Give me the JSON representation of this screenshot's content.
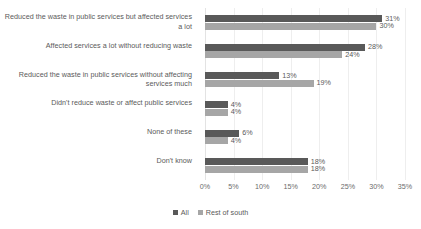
{
  "chart_data": {
    "type": "bar",
    "orientation": "horizontal",
    "title": "",
    "subtitle": "",
    "xlabel": "",
    "ylabel": "",
    "xlim": [
      0,
      35
    ],
    "grid": true,
    "legend_position": "bottom",
    "axis_ticks": [
      "0%",
      "5%",
      "10%",
      "15%",
      "20%",
      "25%",
      "30%",
      "35%"
    ],
    "axis_tick_values": [
      0,
      5,
      10,
      15,
      20,
      25,
      30,
      35
    ],
    "categories": [
      "Reduced the waste in public services but affected services a lot",
      "Affected services a lot without reducing waste",
      "Reduced the waste in public services without affecting services much",
      "Didn't reduce waste or affect public services",
      "None of these",
      "Don't know"
    ],
    "series": [
      {
        "name": "All",
        "color": "#595959",
        "values": [
          31,
          28,
          13,
          4,
          6,
          18
        ],
        "labels": [
          "31%",
          "28%",
          "13%",
          "4%",
          "6%",
          "18%"
        ]
      },
      {
        "name": "Rest of south",
        "color": "#a6a6a6",
        "values": [
          30,
          24,
          19,
          4,
          4,
          18
        ],
        "labels": [
          "30%",
          "24%",
          "19%",
          "4%",
          "4%",
          "18%"
        ]
      }
    ]
  },
  "legend": {
    "items": [
      {
        "label": "All",
        "color": "#595959"
      },
      {
        "label": "Rest of south",
        "color": "#a6a6a6"
      }
    ]
  }
}
